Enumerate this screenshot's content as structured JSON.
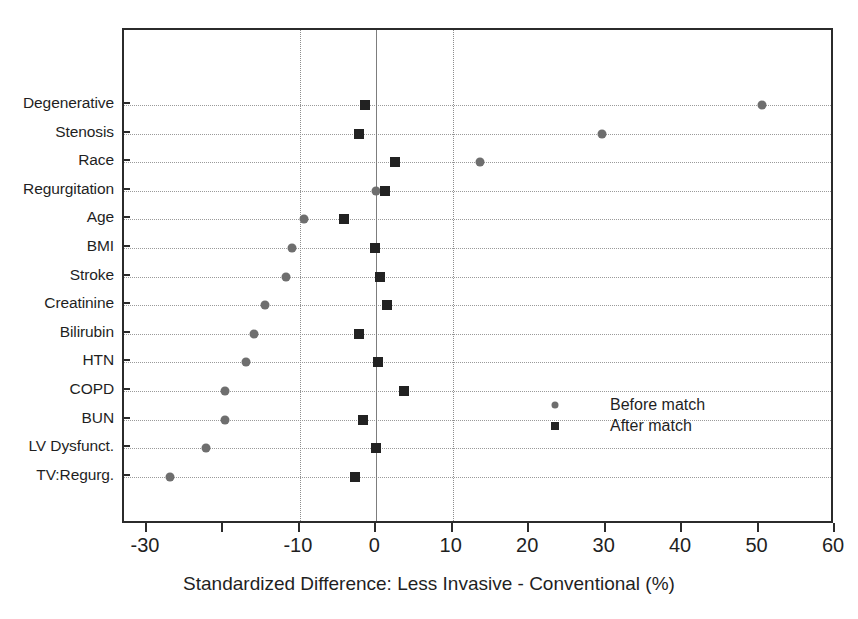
{
  "chart_data": {
    "type": "scatter",
    "title": "",
    "xlabel": "Standardized Difference: Less Invasive - Conventional (%)",
    "ylabel": "",
    "xlim": [
      -33,
      60
    ],
    "xticks": [
      -30,
      -20,
      -10,
      0,
      10,
      20,
      30,
      40,
      50,
      60
    ],
    "xticklabels": [
      "-30",
      "",
      "-10",
      "0",
      "10",
      "20",
      "30",
      "40",
      "50",
      "60"
    ],
    "grid": "horizontal dotted per category; vertical dotted reference lines at -10 and +10; solid vertical line at 0",
    "legend_position": "inside right-center",
    "categories": [
      "Degenerative",
      "Stenosis",
      "Race",
      "Regurgitation",
      "Age",
      "BMI",
      "Stroke",
      "Creatinine",
      "Bilirubin",
      "HTN",
      "COPD",
      "BUN",
      "LV Dysfunct.",
      "TV:Regurg."
    ],
    "series": [
      {
        "name": "Before match",
        "marker": "circle",
        "color": "#6e6e6e",
        "values": [
          50.5,
          29.5,
          13.5,
          0.0,
          -9.5,
          -11.0,
          -11.8,
          -14.5,
          -16.0,
          -17.0,
          -19.8,
          -19.8,
          -22.3,
          -27.0
        ]
      },
      {
        "name": "After match",
        "marker": "square",
        "color": "#222222",
        "values": [
          -1.5,
          -2.3,
          2.5,
          1.2,
          -4.2,
          -0.2,
          0.5,
          1.4,
          -2.2,
          0.2,
          3.6,
          -1.7,
          0.0,
          -2.8
        ]
      }
    ],
    "reference_lines": {
      "solid": [
        0
      ],
      "dotted": [
        -10,
        10
      ]
    }
  },
  "legend": {
    "items": [
      {
        "label": "Before match",
        "marker": "circle"
      },
      {
        "label": "After match",
        "marker": "square"
      }
    ]
  }
}
